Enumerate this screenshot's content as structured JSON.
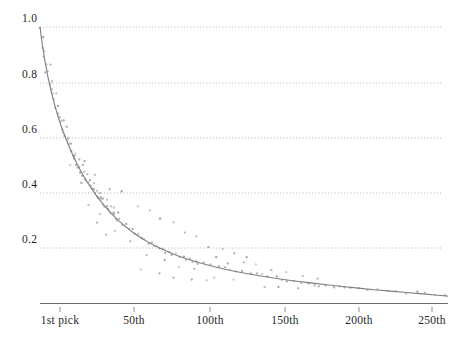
{
  "chart_data": {
    "type": "scatter",
    "title": "",
    "xlabel": "",
    "ylabel": "",
    "xlim": [
      1,
      256
    ],
    "ylim": [
      0,
      1.0
    ],
    "grid": true,
    "legend": null,
    "x_ticks": [
      {
        "value": 1,
        "label": "1st pick",
        "px": 60
      },
      {
        "value": 50,
        "label": "50th",
        "px": 134
      },
      {
        "value": 100,
        "label": "100th",
        "px": 210
      },
      {
        "value": 150,
        "label": "150th",
        "px": 285
      },
      {
        "value": 200,
        "label": "200th",
        "px": 359
      },
      {
        "value": 250,
        "label": "250th",
        "px": 432
      }
    ],
    "y_ticks": [
      {
        "value": 1.0,
        "label": "1.0",
        "px": 27
      },
      {
        "value": 0.8,
        "label": "0.8",
        "px": 83
      },
      {
        "value": 0.6,
        "label": "0.6",
        "px": 138
      },
      {
        "value": 0.4,
        "label": "0.4",
        "px": 193
      },
      {
        "value": 0.2,
        "label": "0.2",
        "px": 248
      }
    ],
    "series": [
      {
        "name": "fitted-curve",
        "type": "line",
        "color": "#777777",
        "model": "exponential-decay",
        "points": [
          [
            1,
            1.0
          ],
          [
            2,
            0.955
          ],
          [
            3,
            0.915
          ],
          [
            4,
            0.88
          ],
          [
            5,
            0.848
          ],
          [
            6,
            0.818
          ],
          [
            7,
            0.791
          ],
          [
            8,
            0.766
          ],
          [
            9,
            0.743
          ],
          [
            10,
            0.721
          ],
          [
            12,
            0.681
          ],
          [
            14,
            0.645
          ],
          [
            16,
            0.613
          ],
          [
            18,
            0.583
          ],
          [
            20,
            0.556
          ],
          [
            22,
            0.53
          ],
          [
            24,
            0.506
          ],
          [
            26,
            0.484
          ],
          [
            28,
            0.463
          ],
          [
            30,
            0.443
          ],
          [
            33,
            0.416
          ],
          [
            36,
            0.391
          ],
          [
            39,
            0.368
          ],
          [
            42,
            0.347
          ],
          [
            45,
            0.328
          ],
          [
            48,
            0.31
          ],
          [
            51,
            0.294
          ],
          [
            54,
            0.279
          ],
          [
            57,
            0.265
          ],
          [
            60,
            0.252
          ],
          [
            65,
            0.233
          ],
          [
            70,
            0.216
          ],
          [
            75,
            0.201
          ],
          [
            80,
            0.188
          ],
          [
            85,
            0.176
          ],
          [
            90,
            0.165
          ],
          [
            95,
            0.156
          ],
          [
            100,
            0.147
          ],
          [
            110,
            0.131
          ],
          [
            120,
            0.118
          ],
          [
            130,
            0.107
          ],
          [
            140,
            0.097
          ],
          [
            150,
            0.088
          ],
          [
            160,
            0.08
          ],
          [
            170,
            0.073
          ],
          [
            180,
            0.066
          ],
          [
            190,
            0.06
          ],
          [
            200,
            0.054
          ],
          [
            210,
            0.048
          ],
          [
            220,
            0.043
          ],
          [
            230,
            0.038
          ],
          [
            240,
            0.033
          ],
          [
            250,
            0.028
          ],
          [
            256,
            0.025
          ]
        ]
      },
      {
        "name": "observed-picks",
        "type": "scatter",
        "color": "#9a9a9a",
        "marker": "dot",
        "points": [
          [
            1,
            1.0
          ],
          [
            2,
            0.968
          ],
          [
            3,
            0.93
          ],
          [
            3,
            0.893
          ],
          [
            4,
            0.905
          ],
          [
            5,
            0.862
          ],
          [
            5,
            0.835
          ],
          [
            6,
            0.845
          ],
          [
            7,
            0.8
          ],
          [
            7,
            0.868
          ],
          [
            8,
            0.781
          ],
          [
            9,
            0.757
          ],
          [
            9,
            0.8
          ],
          [
            10,
            0.735
          ],
          [
            11,
            0.712
          ],
          [
            11,
            0.76
          ],
          [
            12,
            0.69
          ],
          [
            13,
            0.672
          ],
          [
            13,
            0.706
          ],
          [
            14,
            0.651
          ],
          [
            15,
            0.63
          ],
          [
            15,
            0.666
          ],
          [
            16,
            0.618
          ],
          [
            17,
            0.6
          ],
          [
            17,
            0.634
          ],
          [
            18,
            0.585
          ],
          [
            19,
            0.571
          ],
          [
            19,
            0.6
          ],
          [
            20,
            0.557
          ],
          [
            21,
            0.541
          ],
          [
            21,
            0.572
          ],
          [
            22,
            0.53
          ],
          [
            23,
            0.518
          ],
          [
            23,
            0.548
          ],
          [
            24,
            0.505
          ],
          [
            25,
            0.493
          ],
          [
            25,
            0.523
          ],
          [
            26,
            0.484
          ],
          [
            27,
            0.472
          ],
          [
            27,
            0.5
          ],
          [
            28,
            0.463
          ],
          [
            29,
            0.452
          ],
          [
            29,
            0.481
          ],
          [
            30,
            0.443
          ],
          [
            31,
            0.433
          ],
          [
            31,
            0.462
          ],
          [
            32,
            0.425
          ],
          [
            33,
            0.416
          ],
          [
            33,
            0.446
          ],
          [
            34,
            0.407
          ],
          [
            35,
            0.398
          ],
          [
            35,
            0.43
          ],
          [
            36,
            0.391
          ],
          [
            37,
            0.382
          ],
          [
            37,
            0.412
          ],
          [
            38,
            0.375
          ],
          [
            39,
            0.368
          ],
          [
            39,
            0.398
          ],
          [
            40,
            0.36
          ],
          [
            41,
            0.353
          ],
          [
            41,
            0.383
          ],
          [
            42,
            0.347
          ],
          [
            43,
            0.34
          ],
          [
            43,
            0.37
          ],
          [
            44,
            0.334
          ],
          [
            45,
            0.328
          ],
          [
            45,
            0.356
          ],
          [
            46,
            0.322
          ],
          [
            47,
            0.316
          ],
          [
            47,
            0.344
          ],
          [
            48,
            0.31
          ],
          [
            49,
            0.305
          ],
          [
            49,
            0.332
          ],
          [
            50,
            0.299
          ],
          [
            52,
            0.289
          ],
          [
            54,
            0.279
          ],
          [
            56,
            0.27
          ],
          [
            58,
            0.261
          ],
          [
            60,
            0.252
          ],
          [
            62,
            0.244
          ],
          [
            64,
            0.237
          ],
          [
            66,
            0.23
          ],
          [
            68,
            0.223
          ],
          [
            70,
            0.216
          ],
          [
            72,
            0.21
          ],
          [
            74,
            0.204
          ],
          [
            76,
            0.198
          ],
          [
            78,
            0.193
          ],
          [
            80,
            0.188
          ],
          [
            82,
            0.183
          ],
          [
            84,
            0.178
          ],
          [
            86,
            0.174
          ],
          [
            88,
            0.169
          ],
          [
            90,
            0.165
          ],
          [
            92,
            0.161
          ],
          [
            94,
            0.157
          ],
          [
            96,
            0.154
          ],
          [
            98,
            0.15
          ],
          [
            100,
            0.147
          ],
          [
            104,
            0.14
          ],
          [
            108,
            0.134
          ],
          [
            112,
            0.128
          ],
          [
            116,
            0.123
          ],
          [
            120,
            0.118
          ],
          [
            124,
            0.113
          ],
          [
            128,
            0.109
          ],
          [
            132,
            0.105
          ],
          [
            136,
            0.101
          ],
          [
            140,
            0.097
          ],
          [
            144,
            0.094
          ],
          [
            148,
            0.09
          ],
          [
            152,
            0.087
          ],
          [
            156,
            0.083
          ],
          [
            160,
            0.08
          ],
          [
            164,
            0.077
          ],
          [
            168,
            0.074
          ],
          [
            172,
            0.071
          ],
          [
            176,
            0.068
          ],
          [
            180,
            0.066
          ],
          [
            184,
            0.063
          ],
          [
            188,
            0.061
          ],
          [
            192,
            0.058
          ],
          [
            196,
            0.056
          ],
          [
            200,
            0.054
          ],
          [
            206,
            0.05
          ],
          [
            212,
            0.047
          ],
          [
            218,
            0.044
          ],
          [
            224,
            0.041
          ],
          [
            230,
            0.038
          ],
          [
            236,
            0.035
          ],
          [
            242,
            0.032
          ],
          [
            248,
            0.029
          ],
          [
            254,
            0.026
          ],
          [
            28,
            0.52
          ],
          [
            35,
            0.47
          ],
          [
            44,
            0.42
          ],
          [
            53,
            0.4
          ],
          [
            62,
            0.345
          ],
          [
            70,
            0.33
          ],
          [
            77,
            0.3
          ],
          [
            84,
            0.29
          ],
          [
            91,
            0.262
          ],
          [
            99,
            0.245
          ],
          [
            107,
            0.21
          ],
          [
            115,
            0.195
          ],
          [
            123,
            0.178
          ],
          [
            131,
            0.16
          ],
          [
            20,
            0.505
          ],
          [
            26,
            0.432
          ],
          [
            39,
            0.318
          ],
          [
            48,
            0.268
          ],
          [
            58,
            0.22
          ],
          [
            68,
            0.178
          ],
          [
            78,
            0.152
          ],
          [
            88,
            0.133
          ],
          [
            97,
            0.12
          ],
          [
            110,
            0.1
          ],
          [
            122,
            0.09
          ],
          [
            64,
            0.118
          ],
          [
            75,
            0.105
          ],
          [
            85,
            0.098
          ],
          [
            95,
            0.088
          ],
          [
            105,
            0.08
          ],
          [
            42,
            0.255
          ],
          [
            36,
            0.29
          ],
          [
            31,
            0.35
          ],
          [
            145,
            0.12
          ],
          [
            155,
            0.11
          ],
          [
            165,
            0.1
          ],
          [
            175,
            0.092
          ],
          [
            141,
            0.062
          ],
          [
            151,
            0.056
          ],
          [
            163,
            0.05
          ],
          [
            136,
            0.135
          ],
          [
            128,
            0.145
          ],
          [
            119,
            0.15
          ],
          [
            112,
            0.163
          ]
        ]
      }
    ],
    "gridline_color": "#9b9b9b",
    "axis_color": "#6e6e6e",
    "x_axis_px_range": [
      40,
      448
    ],
    "y_axis_baseline_px": 303
  },
  "axes": {
    "y_tick_labels": [
      "1.0",
      "0.8",
      "0.6",
      "0.4",
      "0.2"
    ],
    "x_tick_labels": [
      "1st pick",
      "50th",
      "100th",
      "150th",
      "200th",
      "250th"
    ]
  }
}
